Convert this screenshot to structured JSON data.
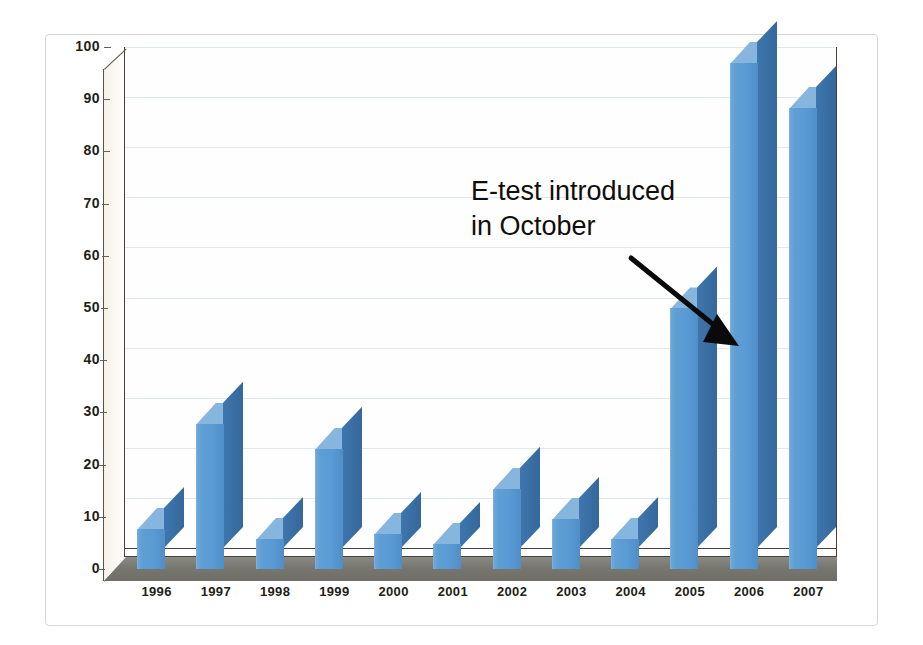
{
  "chart_data": {
    "type": "bar",
    "title": "",
    "subtitle": "",
    "xlabel": "",
    "ylabel": "",
    "categories": [
      "1996",
      "1997",
      "1998",
      "1999",
      "2000",
      "2001",
      "2002",
      "2003",
      "2004",
      "2005",
      "2006",
      "2007"
    ],
    "values": [
      8,
      29,
      6,
      24,
      7,
      5,
      16,
      10,
      6,
      52,
      101,
      92
    ],
    "series": [
      {
        "name": "Count",
        "values": [
          8,
          29,
          6,
          24,
          7,
          5,
          16,
          10,
          6,
          52,
          101,
          92
        ]
      }
    ],
    "ylim": [
      0,
      100
    ],
    "ytick_labels": [
      "0",
      "10",
      "20",
      "30",
      "40",
      "50",
      "60",
      "70",
      "80",
      "90",
      "100"
    ],
    "ytick_values": [
      0,
      10,
      20,
      30,
      40,
      50,
      60,
      70,
      80,
      90,
      100
    ],
    "grid": true,
    "legend": false,
    "legend_position": "none",
    "style": "3d-column",
    "annotations": [
      {
        "name": "e-test-annotation",
        "lines": [
          "E-test introduced",
          "in October"
        ],
        "points_to_category": "2005",
        "arrow": true
      }
    ],
    "colors": {
      "bar_front": "#5B9BD5",
      "bar_side": "#3A70A6",
      "bar_top": "#86B6DE",
      "gridline": "#DFE8F1",
      "axis": "#4A4038",
      "floor": "#77776F",
      "wall": "#FEFEFE",
      "text": "#221D18",
      "card_border": "#D6D6D6",
      "page_background": "#FFFFFF"
    }
  },
  "annotation": {
    "line1": "E-test introduced",
    "line2": "in October"
  }
}
